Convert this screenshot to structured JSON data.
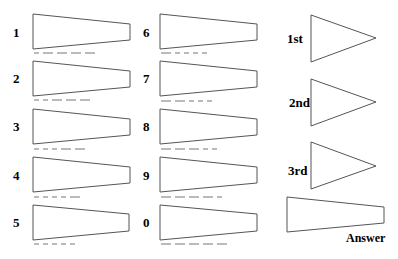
{
  "digits": [
    {
      "label": "1",
      "morse": ".----"
    },
    {
      "label": "2",
      "morse": "..---"
    },
    {
      "label": "3",
      "morse": "...--"
    },
    {
      "label": "4",
      "morse": "....-"
    },
    {
      "label": "5",
      "morse": "....."
    },
    {
      "label": "6",
      "morse": "-...."
    },
    {
      "label": "7",
      "morse": "--..."
    },
    {
      "label": "8",
      "morse": "---.."
    },
    {
      "label": "9",
      "morse": "----."
    },
    {
      "label": "0",
      "morse": "-----"
    }
  ],
  "ordinals": [
    {
      "label": "1st"
    },
    {
      "label": "2nd"
    },
    {
      "label": "3rd"
    }
  ],
  "answer": {
    "label": "Answer"
  },
  "colors": {
    "stroke": "#555555",
    "dash": "#777777",
    "text": "#000000"
  }
}
